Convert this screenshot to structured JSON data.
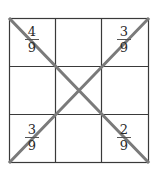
{
  "diagram": {
    "type": "3x3 grid with two crossing diagonals",
    "grid": {
      "rows": 3,
      "cols": 3,
      "line_color": "#3a3a3a"
    },
    "diagonal_color": "#7a7a7a",
    "cells": {
      "top_left": {
        "numerator": "4",
        "denominator": "9"
      },
      "top_right": {
        "numerator": "3",
        "denominator": "9"
      },
      "bottom_left": {
        "numerator": "3",
        "denominator": "9"
      },
      "bottom_right": {
        "numerator": "2",
        "denominator": "9"
      }
    }
  }
}
